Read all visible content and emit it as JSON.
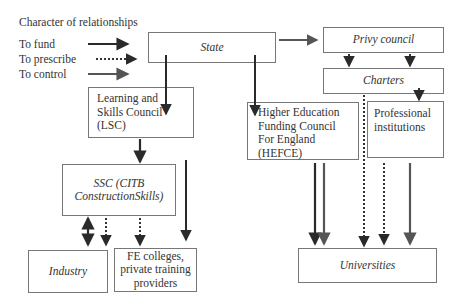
{
  "legend": {
    "title": "Character of relationships",
    "items": [
      {
        "label": "To fund",
        "style": "solid-dark"
      },
      {
        "label": "To prescribe",
        "style": "dotted"
      },
      {
        "label": "To control",
        "style": "solid-grey"
      }
    ]
  },
  "nodes": {
    "state": "State",
    "privy_council": "Privy council",
    "charters": "Charters",
    "lsc": [
      "Learning and",
      "Skills Council",
      "(LSC)"
    ],
    "hefce": [
      "Higher Education",
      "Funding Council",
      "For England",
      "(HEFCE)"
    ],
    "professional": [
      "Professional",
      "institutions"
    ],
    "ssc": [
      "SSC (CITB",
      "ConstructionSkills)"
    ],
    "industry": "Industry",
    "fe": [
      "FE colleges,",
      "private training",
      "providers"
    ],
    "universities": "Universities"
  },
  "edges": [
    {
      "from": "State",
      "to": "Privy council",
      "type": "control"
    },
    {
      "from": "State",
      "to": "LSC",
      "type": "fund"
    },
    {
      "from": "State",
      "to": "HEFCE",
      "type": "fund"
    },
    {
      "from": "Privy council",
      "to": "Charters",
      "type": "prescribe"
    },
    {
      "from": "Charters",
      "to": "Professional institutions",
      "type": "prescribe"
    },
    {
      "from": "Charters",
      "to": "Universities",
      "type": "prescribe"
    },
    {
      "from": "LSC",
      "to": "SSC",
      "type": "fund"
    },
    {
      "from": "LSC",
      "to": "FE colleges",
      "type": "fund"
    },
    {
      "from": "SSC",
      "to": "Industry",
      "type": "fund-bidirectional"
    },
    {
      "from": "SSC",
      "to": "Industry",
      "type": "prescribe"
    },
    {
      "from": "SSC",
      "to": "FE colleges",
      "type": "prescribe"
    },
    {
      "from": "HEFCE",
      "to": "Universities",
      "type": "fund"
    },
    {
      "from": "HEFCE",
      "to": "Universities",
      "type": "control"
    },
    {
      "from": "Professional institutions",
      "to": "Universities",
      "type": "prescribe"
    },
    {
      "from": "Professional institutions",
      "to": "Universities",
      "type": "control"
    }
  ],
  "colors": {
    "fund": "#2a2a2a",
    "control": "#666666",
    "prescribe": "#333333",
    "border": "#777777"
  }
}
